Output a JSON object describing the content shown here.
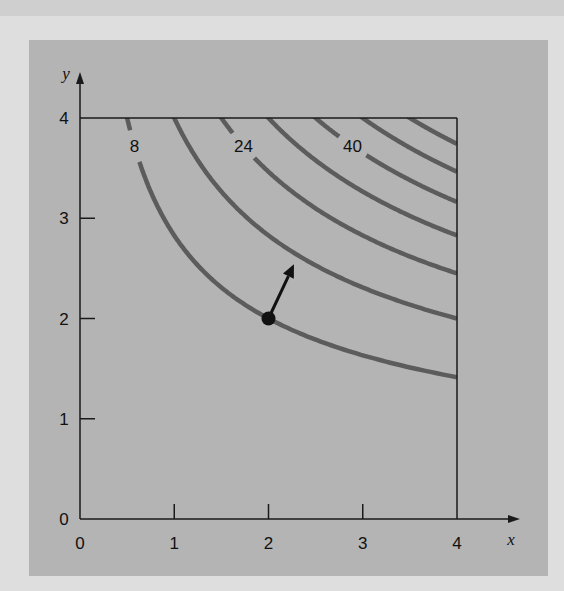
{
  "chart_data": {
    "type": "contour",
    "title": "",
    "function": "f(x, y) = x*y^2",
    "xlabel": "x",
    "ylabel": "y",
    "xlim": [
      0,
      4
    ],
    "ylim": [
      0,
      4
    ],
    "x_ticks": [
      0,
      1,
      2,
      3,
      4
    ],
    "y_ticks": [
      0,
      1,
      2,
      3,
      4
    ],
    "x_tick_labels": [
      "0",
      "1",
      "2",
      "3",
      "4"
    ],
    "y_tick_labels": [
      "0",
      "1",
      "2",
      "3",
      "4"
    ],
    "grid": false,
    "contour_levels": [
      8,
      16,
      24,
      32,
      40,
      48,
      56
    ],
    "labeled_levels": [
      {
        "level": 8,
        "text": "8"
      },
      {
        "level": 24,
        "text": "24"
      },
      {
        "level": 40,
        "text": "40"
      }
    ],
    "point": {
      "x": 2,
      "y": 2
    },
    "gradient_arrow": {
      "from": [
        2,
        2
      ],
      "to": [
        2.27,
        2.54
      ],
      "direction": [
        1,
        2
      ]
    },
    "colors": {
      "contour": "#5c5c5c",
      "axis": "#1a1a1a",
      "point": "#111111",
      "panel": "#b4b4b4",
      "background": "#dedede"
    }
  }
}
